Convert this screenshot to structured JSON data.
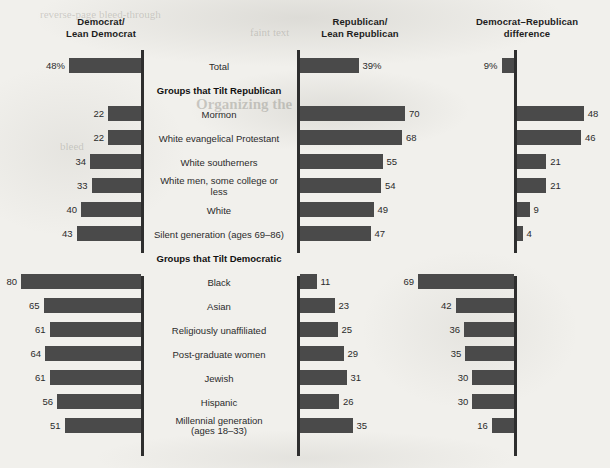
{
  "chart_data": {
    "type": "bar",
    "title": "",
    "orientation": "horizontal",
    "panels": [
      {
        "key": "democrat",
        "header_line1": "Democrat/",
        "header_line2": "Lean Democrat",
        "direction": "left",
        "unit": "%"
      },
      {
        "key": "republican",
        "header_line1": "Republican/",
        "header_line2": "Lean Republican",
        "direction": "right",
        "unit": "%"
      },
      {
        "key": "difference",
        "header_line1": "Democrat–Republican",
        "header_line2": "difference",
        "direction": "signed",
        "unit": "%"
      }
    ],
    "axis_max": 80,
    "grid": false,
    "legend": false,
    "rows": [
      {
        "type": "data",
        "label": "Total",
        "democrat": 48,
        "republican": 39,
        "difference": 9,
        "difference_side": "left",
        "democrat_display": "48%",
        "republican_display": "39%",
        "difference_display": "9%"
      },
      {
        "type": "section",
        "label": "Groups that Tilt Republican"
      },
      {
        "type": "data",
        "label": "Mormon",
        "democrat": 22,
        "republican": 70,
        "difference": 48,
        "difference_side": "right",
        "democrat_display": "22",
        "republican_display": "70",
        "difference_display": "48"
      },
      {
        "type": "data",
        "label": "White evangelical Protestant",
        "democrat": 22,
        "republican": 68,
        "difference": 46,
        "difference_side": "right",
        "democrat_display": "22",
        "republican_display": "68",
        "difference_display": "46"
      },
      {
        "type": "data",
        "label": "White southerners",
        "democrat": 34,
        "republican": 55,
        "difference": 21,
        "difference_side": "right",
        "democrat_display": "34",
        "republican_display": "55",
        "difference_display": "21"
      },
      {
        "type": "data",
        "label": "White men, some college or less",
        "democrat": 33,
        "republican": 54,
        "difference": 21,
        "difference_side": "right",
        "democrat_display": "33",
        "republican_display": "54",
        "difference_display": "21"
      },
      {
        "type": "data",
        "label": "White",
        "democrat": 40,
        "republican": 49,
        "difference": 9,
        "difference_side": "right",
        "democrat_display": "40",
        "republican_display": "49",
        "difference_display": "9"
      },
      {
        "type": "data",
        "label": "Silent generation (ages 69–86)",
        "democrat": 43,
        "republican": 47,
        "difference": 4,
        "difference_side": "right",
        "democrat_display": "43",
        "republican_display": "47",
        "difference_display": "4"
      },
      {
        "type": "section",
        "label": "Groups that Tilt Democratic"
      },
      {
        "type": "data",
        "label": "Black",
        "democrat": 80,
        "republican": 11,
        "difference": 69,
        "difference_side": "left",
        "democrat_display": "80",
        "republican_display": "11",
        "difference_display": "69"
      },
      {
        "type": "data",
        "label": "Asian",
        "democrat": 65,
        "republican": 23,
        "difference": 42,
        "difference_side": "left",
        "democrat_display": "65",
        "republican_display": "23",
        "difference_display": "42"
      },
      {
        "type": "data",
        "label": "Religiously unaffiliated",
        "democrat": 61,
        "republican": 25,
        "difference": 36,
        "difference_side": "left",
        "democrat_display": "61",
        "republican_display": "25",
        "difference_display": "36"
      },
      {
        "type": "data",
        "label": "Post-graduate women",
        "democrat": 64,
        "republican": 29,
        "difference": 35,
        "difference_side": "left",
        "democrat_display": "64",
        "republican_display": "29",
        "difference_display": "35"
      },
      {
        "type": "data",
        "label": "Jewish",
        "democrat": 61,
        "republican": 31,
        "difference": 30,
        "difference_side": "left",
        "democrat_display": "61",
        "republican_display": "31",
        "difference_display": "30"
      },
      {
        "type": "data",
        "label": "Hispanic",
        "democrat": 56,
        "republican": 26,
        "difference": 30,
        "difference_side": "left",
        "democrat_display": "56",
        "republican_display": "26",
        "difference_display": "30"
      },
      {
        "type": "data",
        "label": "Millennial generation",
        "label_line2": "(ages 18–33)",
        "democrat": 51,
        "republican": 35,
        "difference": 16,
        "difference_side": "left",
        "democrat_display": "51",
        "republican_display": "35",
        "difference_display": "16"
      }
    ],
    "colors": {
      "bar": "#4a4a4a",
      "axis": "#2e2e2e",
      "background": "#f1f0ec",
      "text": "#2b2b2b"
    }
  },
  "background_bleed": [
    {
      "text": "reverse-page bleed-through",
      "x": 40,
      "y": 8,
      "size": 11,
      "bold": false
    },
    {
      "text": "faint text",
      "x": 250,
      "y": 26,
      "size": 11,
      "bold": false
    },
    {
      "text": "Organizing the",
      "x": 196,
      "y": 96,
      "size": 15,
      "bold": true
    },
    {
      "text": "bleed",
      "x": 60,
      "y": 140,
      "size": 11,
      "bold": false
    },
    {
      "text": "ghost",
      "x": 470,
      "y": 300,
      "size": 11,
      "bold": false
    }
  ]
}
